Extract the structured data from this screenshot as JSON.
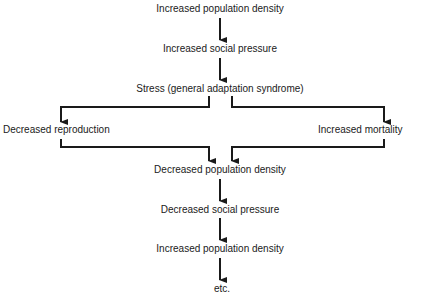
{
  "nodes": {
    "n1": "Increased population density",
    "n2": "Increased social pressure",
    "n3": "Stress (general adaptation syndrome)",
    "left": "Decreased reproduction",
    "right": "Increased mortality",
    "n4": "Decreased population density",
    "n5": "Decreased social pressure",
    "n6": "Increased population density",
    "n7": "etc."
  },
  "colors": {
    "line": "#1a1a1a",
    "text": "#1a1a1a"
  }
}
